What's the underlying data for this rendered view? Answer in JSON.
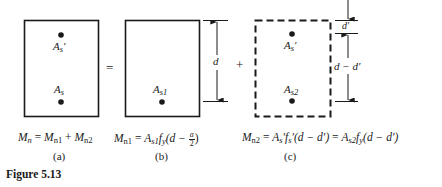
{
  "figure": {
    "caption": "Figure 5.13",
    "operators": {
      "equals": "=",
      "plus": "+"
    },
    "panels": [
      {
        "id": "a",
        "label": "(a)",
        "box_style": "solid",
        "bars": [
          {
            "name": "A",
            "sub": "s",
            "prime": "′",
            "position": "top"
          },
          {
            "name": "A",
            "sub": "s",
            "prime": "",
            "position": "bottom"
          }
        ],
        "equation": {
          "lhs": {
            "sym": "M",
            "sub": "n"
          },
          "rhs_1": {
            "sym": "M",
            "sub": "n1"
          },
          "op": "+",
          "rhs_2": {
            "sym": "M",
            "sub": "n2"
          }
        }
      },
      {
        "id": "b",
        "label": "(b)",
        "box_style": "solid",
        "bars": [
          {
            "name": "A",
            "sub": "s1",
            "position": "bottom"
          }
        ],
        "dimension": {
          "label": "d"
        },
        "equation": {
          "lhs": {
            "sym": "M",
            "sub": "n1"
          },
          "rhs": "A_s1 f_y (d − a/2)",
          "a_sym": "A",
          "a_sub": "s1",
          "f_sym": "f",
          "f_sub": "y",
          "paren_open": "(d − ",
          "frac_num": "a",
          "frac_den": "2",
          "paren_close": ")"
        }
      },
      {
        "id": "c",
        "label": "(c)",
        "box_style": "dashed",
        "bars": [
          {
            "name": "A",
            "sub": "s",
            "prime": "′",
            "position": "top"
          },
          {
            "name": "A",
            "sub": "s2",
            "prime": "",
            "position": "bottom"
          }
        ],
        "dimensions": {
          "top": "d′",
          "main": "d − d′"
        },
        "equation": {
          "lhs": {
            "sym": "M",
            "sub": "n2"
          },
          "part1": "A",
          "part1_sub": "s",
          "part1_rest": "′f",
          "part1_sub2": "s",
          "part1_tail": "′(d − d′)",
          "eq2": " = ",
          "part2": "A",
          "part2_sub": "s2",
          "part2_f": "f",
          "part2_fsub": "y",
          "part2_tail": "(d − d′)"
        }
      }
    ]
  },
  "colors": {
    "ink": "#1a1a1a",
    "background": "#ffffff"
  }
}
